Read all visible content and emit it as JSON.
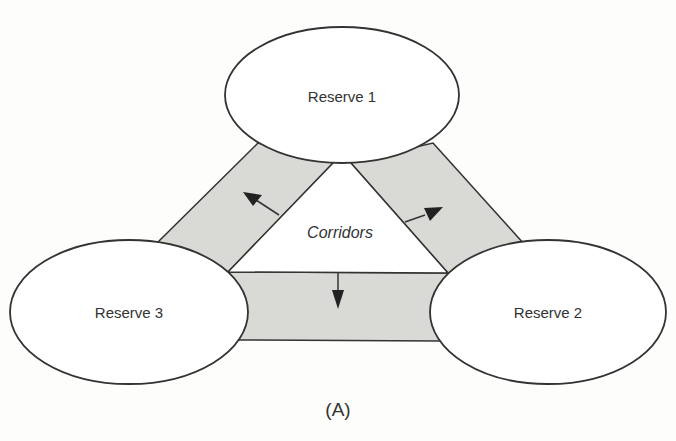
{
  "figure": {
    "caption": "(A)",
    "reserves": [
      {
        "id": "reserve-1",
        "label": "Reserve 1"
      },
      {
        "id": "reserve-2",
        "label": "Reserve 2"
      },
      {
        "id": "reserve-3",
        "label": "Reserve 3"
      }
    ],
    "center_label": "Corridors",
    "colors": {
      "corridor_fill": "#d9d9d6",
      "stroke": "#333333",
      "reserve_fill": "#ffffff"
    }
  }
}
